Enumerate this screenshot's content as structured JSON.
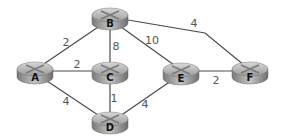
{
  "graph": {
    "nodes": [
      {
        "id": "A",
        "label": "A",
        "x": 35,
        "y": 73
      },
      {
        "id": "B",
        "label": "B",
        "x": 110,
        "y": 19
      },
      {
        "id": "C",
        "label": "C",
        "x": 110,
        "y": 73
      },
      {
        "id": "D",
        "label": "D",
        "x": 110,
        "y": 123
      },
      {
        "id": "E",
        "label": "E",
        "x": 181,
        "y": 74
      },
      {
        "id": "F",
        "label": "F",
        "x": 250,
        "y": 73
      }
    ],
    "edges": [
      {
        "from": "A",
        "to": "B",
        "weight": "2",
        "lx": 66,
        "ly": 42
      },
      {
        "from": "B",
        "to": "C",
        "weight": "8",
        "lx": 116,
        "ly": 46
      },
      {
        "from": "B",
        "to": "E",
        "weight": "10",
        "lx": 152,
        "ly": 40
      },
      {
        "from": "B",
        "to": "F",
        "weight": "4",
        "lx": 194,
        "ly": 23
      },
      {
        "from": "A",
        "to": "C",
        "weight": "2",
        "lx": 77,
        "ly": 64
      },
      {
        "from": "A",
        "to": "D",
        "weight": "4",
        "lx": 66,
        "ly": 101
      },
      {
        "from": "C",
        "to": "D",
        "weight": "1",
        "lx": 114,
        "ly": 98
      },
      {
        "from": "D",
        "to": "E",
        "weight": "4",
        "lx": 145,
        "ly": 104
      },
      {
        "from": "E",
        "to": "F",
        "weight": "2",
        "lx": 216,
        "ly": 80
      }
    ]
  }
}
